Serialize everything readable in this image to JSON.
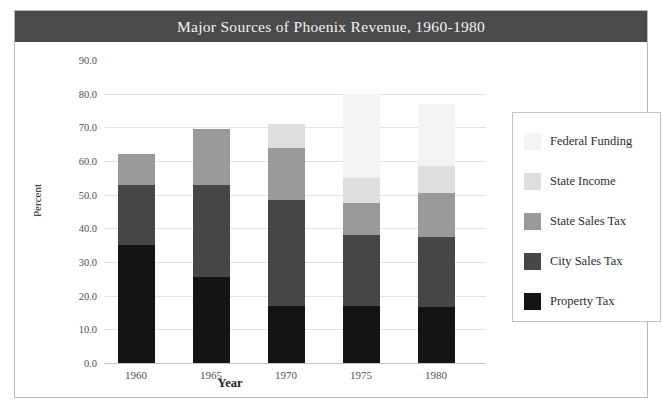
{
  "figure": {
    "title": "Major Sources of Phoenix Revenue, 1960-1980",
    "title_bar_color": "#4a4a4c",
    "background_color": "#ffffff",
    "border_color": "#b9b9bd"
  },
  "chart_data": {
    "type": "bar",
    "subtype": "stacked-bar",
    "title": "Major Sources of Phoenix Revenue, 1960-1980",
    "xlabel": "Year",
    "ylabel": "Percent",
    "categories": [
      "1960",
      "1965",
      "1970",
      "1975",
      "1980"
    ],
    "ylim": [
      0.0,
      90.0
    ],
    "yticks": [
      "0.0",
      "10.0",
      "20.0",
      "30.0",
      "40.0",
      "50.0",
      "60.0",
      "70.0",
      "80.0",
      "90.0"
    ],
    "ytick_values": [
      0,
      10,
      20,
      30,
      40,
      50,
      60,
      70,
      80,
      90
    ],
    "grid": true,
    "legend_position": "right",
    "stack_order_bottom_to_top": [
      "Property Tax",
      "City Sales Tax",
      "State Sales Tax",
      "State Income",
      "Federal Funding"
    ],
    "series": [
      {
        "name": "Property Tax",
        "color": "#141414",
        "values": [
          35.0,
          25.5,
          17.0,
          17.0,
          16.5
        ]
      },
      {
        "name": "City Sales Tax",
        "color": "#474749",
        "values": [
          18.0,
          27.5,
          31.5,
          21.0,
          21.0
        ]
      },
      {
        "name": "State Sales Tax",
        "color": "#9a9a9c",
        "values": [
          9.0,
          16.5,
          15.5,
          9.5,
          13.0
        ]
      },
      {
        "name": "State Income",
        "color": "#dedede",
        "values": [
          0.0,
          0.0,
          7.0,
          7.5,
          8.0
        ]
      },
      {
        "name": "Federal Funding",
        "color": "#f4f4f4",
        "values": [
          0.0,
          0.0,
          0.0,
          25.0,
          18.5
        ]
      }
    ],
    "totals": [
      62.0,
      69.5,
      71.0,
      80.0,
      77.0
    ]
  },
  "legend": {
    "entries": [
      {
        "label": "Federal Funding",
        "color": "#f4f4f4"
      },
      {
        "label": "State Income",
        "color": "#dedede"
      },
      {
        "label": "State Sales Tax",
        "color": "#9a9a9c"
      },
      {
        "label": "City Sales Tax",
        "color": "#474749"
      },
      {
        "label": "Property Tax",
        "color": "#141414"
      }
    ]
  }
}
